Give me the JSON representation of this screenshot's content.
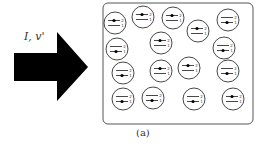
{
  "diagram": {
    "arrow_label": "I, v'",
    "caption": "(a)",
    "atoms": [
      {
        "cx": 115,
        "cy": 23,
        "state": "upper"
      },
      {
        "cx": 143,
        "cy": 17,
        "state": "upper"
      },
      {
        "cx": 173,
        "cy": 18,
        "state": "upper"
      },
      {
        "cx": 198,
        "cy": 31,
        "state": "upper"
      },
      {
        "cx": 228,
        "cy": 20,
        "state": "lower"
      },
      {
        "cx": 117,
        "cy": 49,
        "state": "lower"
      },
      {
        "cx": 161,
        "cy": 43,
        "state": "upper"
      },
      {
        "cx": 224,
        "cy": 48,
        "state": "lower"
      },
      {
        "cx": 123,
        "cy": 73,
        "state": "lower"
      },
      {
        "cx": 161,
        "cy": 71,
        "state": "upper"
      },
      {
        "cx": 189,
        "cy": 68,
        "state": "upper"
      },
      {
        "cx": 228,
        "cy": 71,
        "state": "lower"
      },
      {
        "cx": 123,
        "cy": 99,
        "state": "lower"
      },
      {
        "cx": 153,
        "cy": 98,
        "state": "lower"
      },
      {
        "cx": 194,
        "cy": 99,
        "state": "lower"
      },
      {
        "cx": 233,
        "cy": 99,
        "state": "upper"
      }
    ],
    "level_labels": [
      "2",
      "1"
    ]
  }
}
